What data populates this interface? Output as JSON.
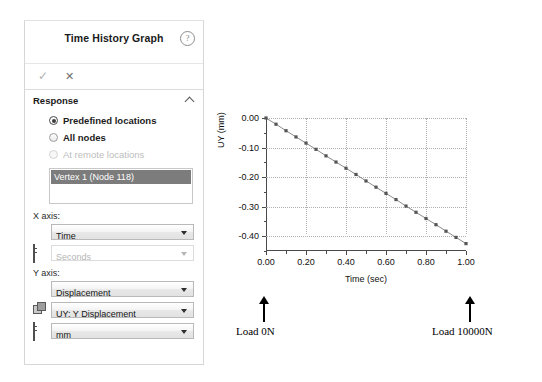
{
  "panel": {
    "title": "Time History Graph",
    "help_icon": "help-icon",
    "actions": {
      "accept": "✓",
      "cancel": "✕"
    },
    "section": {
      "label": "Response",
      "collapse_icon": "chevron-up-icon"
    },
    "radios": [
      {
        "label": "Predefined locations",
        "checked": true,
        "disabled": false
      },
      {
        "label": "All nodes",
        "checked": false,
        "disabled": false
      },
      {
        "label": "At remote locations",
        "checked": false,
        "disabled": true
      }
    ],
    "node_list": {
      "selected": "Vertex 1 (Node 118)"
    },
    "x_axis": {
      "label": "X axis:",
      "quantity": "Time",
      "unit": "Seconds",
      "unit_disabled": true
    },
    "y_axis": {
      "label": "Y axis:",
      "quantity": "Displacement",
      "component": "UY: Y Displacement",
      "unit": "mm"
    }
  },
  "annotations": {
    "left": "Load 0N",
    "right": "Load 10000N"
  },
  "chart_data": {
    "type": "line",
    "title": "",
    "xlabel": "Time (sec)",
    "ylabel": "UY (mm)",
    "xlim": [
      0.0,
      1.0
    ],
    "ylim": [
      -0.45,
      0.0
    ],
    "xticks": [
      "0.00",
      "0.20",
      "0.40",
      "0.60",
      "0.80",
      "1.00"
    ],
    "xtick_values": [
      0.0,
      0.2,
      0.4,
      0.6,
      0.8,
      1.0
    ],
    "xminor_values": [
      0.1,
      0.3,
      0.5,
      0.7,
      0.9
    ],
    "yticks": [
      "0.00",
      "-0.10",
      "-0.20",
      "-0.30",
      "-0.40"
    ],
    "ytick_values": [
      0.0,
      -0.1,
      -0.2,
      -0.3,
      -0.4
    ],
    "yminor_values": [
      -0.05,
      -0.15,
      -0.25,
      -0.35,
      -0.45
    ],
    "grid": true,
    "legend": false,
    "marker": "square",
    "line_color": "#8a8a8a",
    "marker_color": "#555555",
    "series": [
      {
        "name": "UY: Y Displacement",
        "x": [
          0.0,
          0.05,
          0.1,
          0.15,
          0.2,
          0.25,
          0.3,
          0.35,
          0.4,
          0.45,
          0.5,
          0.55,
          0.6,
          0.65,
          0.7,
          0.75,
          0.8,
          0.85,
          0.9,
          0.95,
          1.0
        ],
        "y": [
          0.0,
          -0.021,
          -0.043,
          -0.064,
          -0.085,
          -0.106,
          -0.128,
          -0.149,
          -0.17,
          -0.191,
          -0.213,
          -0.234,
          -0.255,
          -0.276,
          -0.298,
          -0.319,
          -0.34,
          -0.361,
          -0.383,
          -0.404,
          -0.425
        ]
      }
    ]
  }
}
